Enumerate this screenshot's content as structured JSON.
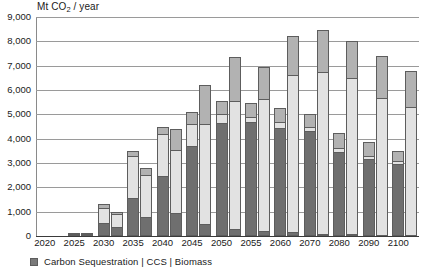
{
  "chart_data": {
    "type": "bar",
    "title": "",
    "subtitle": "",
    "xlabel": "",
    "ylabel": "Mt CO2 / year",
    "ylabel_parts": {
      "pre": "Mt CO",
      "sub": "2",
      "post": " / year"
    },
    "ylim": [
      0,
      9000
    ],
    "ytick_values": [
      0,
      1000,
      2000,
      3000,
      4000,
      5000,
      6000,
      7000,
      8000,
      9000
    ],
    "ytick_labels": [
      "0",
      "1,000",
      "2,000",
      "3,000",
      "4,000",
      "5,000",
      "6,000",
      "7,000",
      "8,000",
      "9,000"
    ],
    "grid": true,
    "grid_axis": "y",
    "legend_position": "bottom-left",
    "legend_text": "Carbon Sequestration | CCS | Biomass",
    "legend_entries": [
      {
        "name": "Carbon Sequestration",
        "color": "#6f6f6f"
      },
      {
        "name": "CCS",
        "color": "#e2e2e2"
      },
      {
        "name": "Biomass",
        "color": "#b2b2b2"
      }
    ],
    "stack_order": [
      "Carbon Sequestration",
      "CCS",
      "Biomass"
    ],
    "categories": [
      "2020",
      "2025",
      "2030",
      "2035",
      "2040",
      "2045",
      "2050",
      "2055",
      "2060",
      "2070",
      "2080",
      "2090",
      "2100"
    ],
    "bars_per_category": 2,
    "series": [
      {
        "name": "Scenario A (left bar)",
        "stacks": [
          {
            "Carbon Sequestration": 0,
            "CCS": 0,
            "Biomass": 0,
            "total": 0
          },
          {
            "Carbon Sequestration": 60,
            "CCS": 20,
            "Biomass": 20,
            "total": 100
          },
          {
            "Carbon Sequestration": 550,
            "CCS": 600,
            "Biomass": 150,
            "total": 1300
          },
          {
            "Carbon Sequestration": 1550,
            "CCS": 1750,
            "Biomass": 200,
            "total": 3500
          },
          {
            "Carbon Sequestration": 2450,
            "CCS": 1750,
            "Biomass": 300,
            "total": 4500
          },
          {
            "Carbon Sequestration": 3700,
            "CCS": 900,
            "Biomass": 500,
            "total": 5100
          },
          {
            "Carbon Sequestration": 4650,
            "CCS": 350,
            "Biomass": 550,
            "total": 5550
          },
          {
            "Carbon Sequestration": 4700,
            "CCS": 200,
            "Biomass": 550,
            "total": 5450
          },
          {
            "Carbon Sequestration": 4450,
            "CCS": 250,
            "Biomass": 550,
            "total": 5250
          },
          {
            "Carbon Sequestration": 4300,
            "CCS": 200,
            "Biomass": 500,
            "total": 5000
          },
          {
            "Carbon Sequestration": 3450,
            "CCS": 150,
            "Biomass": 650,
            "total": 4250
          },
          {
            "Carbon Sequestration": 3150,
            "CCS": 150,
            "Biomass": 550,
            "total": 3850
          },
          {
            "Carbon Sequestration": 2950,
            "CCS": 150,
            "Biomass": 400,
            "total": 3500
          }
        ]
      },
      {
        "name": "Scenario B (right bar)",
        "stacks": [
          {
            "Carbon Sequestration": 0,
            "CCS": 0,
            "Biomass": 0,
            "total": 0
          },
          {
            "Carbon Sequestration": 40,
            "CCS": 30,
            "Biomass": 20,
            "total": 90
          },
          {
            "Carbon Sequestration": 380,
            "CCS": 520,
            "Biomass": 100,
            "total": 1000
          },
          {
            "Carbon Sequestration": 800,
            "CCS": 1700,
            "Biomass": 300,
            "total": 2800
          },
          {
            "Carbon Sequestration": 950,
            "CCS": 2600,
            "Biomass": 850,
            "total": 4400
          },
          {
            "Carbon Sequestration": 500,
            "CCS": 4100,
            "Biomass": 1600,
            "total": 6200
          },
          {
            "Carbon Sequestration": 300,
            "CCS": 5250,
            "Biomass": 1800,
            "total": 7350
          },
          {
            "Carbon Sequestration": 200,
            "CCS": 5450,
            "Biomass": 1300,
            "total": 6950
          },
          {
            "Carbon Sequestration": 150,
            "CCS": 6450,
            "Biomass": 1600,
            "total": 8200
          },
          {
            "Carbon Sequestration": 100,
            "CCS": 6650,
            "Biomass": 1700,
            "total": 8450
          },
          {
            "Carbon Sequestration": 80,
            "CCS": 6400,
            "Biomass": 1520,
            "total": 8000
          },
          {
            "Carbon Sequestration": 60,
            "CCS": 5600,
            "Biomass": 1740,
            "total": 7400
          },
          {
            "Carbon Sequestration": 50,
            "CCS": 5250,
            "Biomass": 1500,
            "total": 6800
          }
        ]
      }
    ]
  }
}
